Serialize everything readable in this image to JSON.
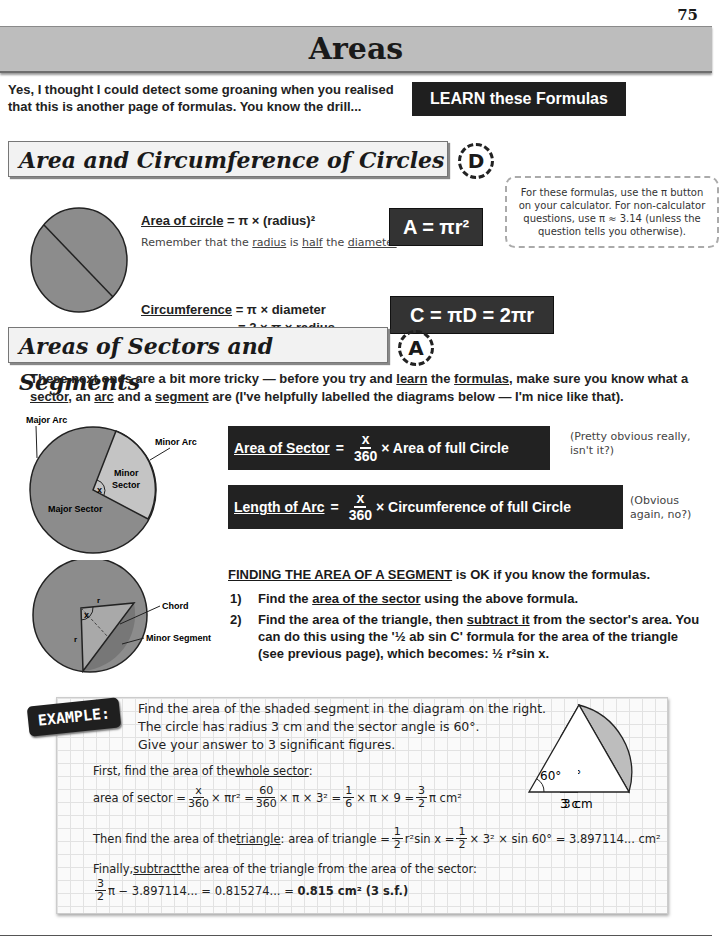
{
  "page_number": "75",
  "title": "Areas",
  "intro": "Yes, I thought I could detect some groaning when you realised that this is another page of formulas.  You know the drill...",
  "learn_button": "LEARN these Formulas",
  "section1": {
    "heading": "Area and Circumference of Circles",
    "grade": "D",
    "area_label": "Area of circle",
    "area_rhs": " = π × (radius)²",
    "radius_note": {
      "pre": "Remember that the ",
      "radius": "radius",
      "mid": " is ",
      "half": "half",
      "mid2": " the ",
      "diameter": "diameter",
      "end": "."
    },
    "circ_label": "Circumference",
    "circ_rhs1": " = π × diameter",
    "circ_rhs2": "= 2 × π × radius",
    "formula_area": "A = πr²",
    "formula_circ": "C = πD = 2πr",
    "calc_note": "For these formulas, use the π button on your calculator.  For non-calculator questions, use π ≈ 3.14 (unless the question tells you otherwise)."
  },
  "section2": {
    "heading": "Areas of Sectors and Segments",
    "grade": "A",
    "para": {
      "p1": "These next ones are a bit more tricky — before you try and ",
      "learn": "learn",
      "p2": " the ",
      "formulas": "formulas",
      "p3": ", make sure you know what a ",
      "sector": "sector",
      "p4": ", an ",
      "arc": "arc",
      "p5": " and a ",
      "segment": "segment",
      "p6": " are (I've helpfully labelled the diagrams below — I'm nice like that)."
    },
    "diagram1_labels": {
      "major_arc": "Major Arc",
      "minor_arc": "Minor Arc",
      "minor_sector_1": "Minor",
      "minor_sector_2": "Sector",
      "major_sector": "Major Sector",
      "angle": "x"
    },
    "sector_formula": {
      "label": "Area of Sector",
      "eq": "=",
      "num": "x",
      "den": "360",
      "rhs": "× Area of full Circle"
    },
    "sector_aside": "(Pretty obvious really, isn't it?)",
    "arc_formula": {
      "label": "Length of Arc",
      "eq": "=",
      "num": "x",
      "den": "360",
      "rhs": "× Circumference of full Circle"
    },
    "arc_aside": "(Obvious again, no?)",
    "diagram2_labels": {
      "chord": "Chord",
      "minor_segment": "Minor Segment",
      "radius": "r",
      "angle": "x"
    },
    "segment_heading": "FINDING THE AREA OF A SEGMENT",
    "segment_heading_rest": " is OK if you know the formulas.",
    "steps": [
      {
        "n": "1)",
        "pre": "Find the ",
        "u": "area of the sector",
        "post": " using the above formula."
      },
      {
        "n": "2)",
        "pre": "Find the area of the triangle, then ",
        "u": "subtract it",
        "post": " from the sector's area. You can do this using the '½ ab sin C' formula for the area of the triangle (see previous page), which becomes:  ½ r²sin x."
      }
    ]
  },
  "example": {
    "badge": "EXAMPLE:",
    "question": [
      "Find the area of the shaded segment in the diagram on the right.",
      "The circle has radius 3 cm and the sector angle is 60°.",
      "Give your answer to 3 significant figures."
    ],
    "step1_pre": "First, find the area of the ",
    "step1_u": "whole sector",
    "step1_post": ":",
    "calc1": {
      "lhs": "area of sector = ",
      "f1n": "x",
      "f1d": "360",
      "t1": " × πr² = ",
      "f2n": "60",
      "f2d": "360",
      "t2": " × π × 3² = ",
      "f3n": "1",
      "f3d": "6",
      "t3": " × π × 9 = ",
      "f4n": "3",
      "f4d": "2",
      "t4": "π cm²"
    },
    "step2_pre": "Then find the area of the ",
    "step2_u": "triangle",
    "step2_post": ":  area of triangle = ",
    "calc2": {
      "f1n": "1",
      "f1d": "2",
      "t1": "r²sin x = ",
      "f2n": "1",
      "f2d": "2",
      "t2": " × 3² × sin 60° = 3.897114... cm²"
    },
    "step3_pre": "Finally, ",
    "step3_u": "subtract",
    "step3_post": " the area of the triangle from the area of the sector:",
    "calc3": {
      "fn": "3",
      "fd": "2",
      "t1": "π − 3.897114... = 0.815274... = ",
      "answer": "0.815 cm² (3 s.f.)"
    },
    "diagram": {
      "angle": "60°",
      "side": "3 cm"
    }
  },
  "colors": {
    "title_bar": "#bdbdbd",
    "box_dark": "#222222",
    "sector_major": "#8c8c8c",
    "sector_minor": "#c4c4c4"
  }
}
